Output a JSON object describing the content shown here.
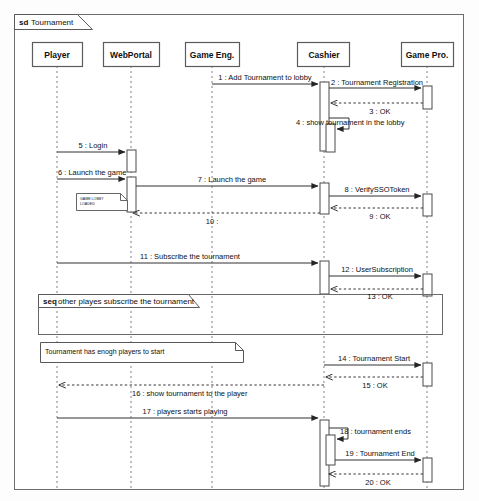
{
  "diagram": {
    "kind": "uml-sequence-diagram",
    "frame": {
      "keyword": "sd",
      "name": "Tournament"
    },
    "colors": {
      "line": "#303030",
      "lifeline": "#707070",
      "box_fill": "#ffffff",
      "text": "#101010"
    },
    "lifelines": [
      {
        "id": "player",
        "label": "Player",
        "x": 57,
        "box_x": 32,
        "box_w": 50
      },
      {
        "id": "webportal",
        "label": "WebPortal",
        "x": 131,
        "box_x": 104,
        "box_w": 56
      },
      {
        "id": "gameeng",
        "label": "Game Eng.",
        "x": 212,
        "box_x": 186,
        "box_w": 54
      },
      {
        "id": "cashier",
        "label": "Cashier",
        "x": 324,
        "box_x": 298,
        "box_w": 52
      },
      {
        "id": "gamepro",
        "label": "Game Pro.",
        "x": 427,
        "box_x": 402,
        "box_w": 52
      }
    ],
    "messages": [
      {
        "num": "1",
        "text": "1 : Add Tournament to lobby",
        "from": "gameeng",
        "to": "cashier",
        "y": 79,
        "style": "solid",
        "dir": "right"
      },
      {
        "num": "2",
        "text": "2 : Tournament Registration",
        "from": "cashier",
        "to": "gamepro",
        "y": 84,
        "style": "solid",
        "dir": "right"
      },
      {
        "num": "3",
        "text": "3 : OK",
        "from": "gamepro",
        "to": "cashier",
        "y": 104,
        "style": "dashed",
        "dir": "left"
      },
      {
        "num": "4",
        "text": "4 : show tournament in the lobby",
        "from": "cashier",
        "to": "cashier",
        "y": 124,
        "style": "solid",
        "dir": "self"
      },
      {
        "num": "5",
        "text": "5 : Login",
        "from": "player",
        "to": "webportal",
        "y": 148,
        "style": "solid",
        "dir": "right"
      },
      {
        "num": "6",
        "text": "6 : Launch the game",
        "from": "player",
        "to": "webportal",
        "y": 175,
        "style": "solid",
        "dir": "right"
      },
      {
        "num": "7",
        "text": "7 : Launch the game",
        "from": "webportal",
        "to": "cashier",
        "y": 180,
        "style": "solid",
        "dir": "right"
      },
      {
        "num": "8",
        "text": "8 : VerifySSOToken",
        "from": "cashier",
        "to": "gamepro",
        "y": 192,
        "style": "solid",
        "dir": "right"
      },
      {
        "num": "9",
        "text": "9 : OK",
        "from": "gamepro",
        "to": "cashier",
        "y": 209,
        "style": "dashed",
        "dir": "left"
      },
      {
        "num": "10",
        "text": "10 :",
        "from": "cashier",
        "to": "webportal",
        "y": 213,
        "style": "dashed",
        "dir": "left"
      },
      {
        "num": "11",
        "text": "11 : Subscribe the tournament",
        "from": "player",
        "to": "cashier",
        "y": 259,
        "style": "solid",
        "dir": "right"
      },
      {
        "num": "12",
        "text": "12 : UserSubscription",
        "from": "cashier",
        "to": "gamepro",
        "y": 272,
        "style": "solid",
        "dir": "right"
      },
      {
        "num": "13",
        "text": "13 : OK",
        "from": "gamepro",
        "to": "cashier",
        "y": 289,
        "style": "dashed",
        "dir": "left"
      },
      {
        "num": "14",
        "text": "14 : Tournament Start",
        "from": "cashier",
        "to": "gamepro",
        "y": 361,
        "style": "solid",
        "dir": "right"
      },
      {
        "num": "15",
        "text": "15 : OK",
        "from": "gamepro",
        "to": "cashier",
        "y": 378,
        "style": "dashed",
        "dir": "left"
      },
      {
        "num": "16",
        "text": "16 : show tournament to the player",
        "from": "cashier",
        "to": "player",
        "y": 385,
        "style": "dashed",
        "dir": "left"
      },
      {
        "num": "17",
        "text": "17 : players starts playing",
        "from": "player",
        "to": "cashier",
        "y": 418,
        "style": "solid",
        "dir": "right"
      },
      {
        "num": "18",
        "text": "18 : tournament ends",
        "from": "cashier",
        "to": "cashier",
        "y": 434,
        "style": "solid",
        "dir": "self"
      },
      {
        "num": "19",
        "text": "19 : Tournament End",
        "from": "cashier",
        "to": "gamepro",
        "y": 456,
        "style": "solid",
        "dir": "right"
      },
      {
        "num": "20",
        "text": "20 : OK",
        "from": "gamepro",
        "to": "cashier",
        "y": 483,
        "style": "dashed",
        "dir": "left"
      }
    ],
    "fragments": [
      {
        "id": "seq-other-players",
        "keyword": "seq",
        "name": "other playes subscribe the tournament",
        "x": 38,
        "y": 294,
        "w": 404,
        "h": 40,
        "tab_w": 160,
        "tab_h": 13
      }
    ],
    "notes": [
      {
        "id": "note-game-lobby",
        "text": "GAME LOBBY LOADED",
        "lines": [
          "GAME LOBBY",
          "LOADED"
        ],
        "x": 76,
        "y": 193,
        "w": 51,
        "h": 17,
        "size": "tiny"
      },
      {
        "id": "note-enough-players",
        "text": "Tournament has enogh players to start",
        "lines": [
          "Tournament has enogh players to start"
        ],
        "x": 40,
        "y": 342,
        "w": 203,
        "h": 20,
        "size": "normal"
      }
    ],
    "activations": [
      {
        "on": "cashier",
        "x": 320,
        "y": 82,
        "w": 9,
        "h": 69
      },
      {
        "on": "cashier",
        "x": 326,
        "y": 124,
        "w": 9,
        "h": 28
      },
      {
        "on": "gamepro",
        "x": 423,
        "y": 86,
        "w": 9,
        "h": 23
      },
      {
        "on": "webportal",
        "x": 127,
        "y": 150,
        "w": 9,
        "h": 22
      },
      {
        "on": "webportal",
        "x": 127,
        "y": 177,
        "w": 9,
        "h": 35
      },
      {
        "on": "cashier",
        "x": 320,
        "y": 183,
        "w": 9,
        "h": 31
      },
      {
        "on": "gamepro",
        "x": 423,
        "y": 194,
        "w": 9,
        "h": 22
      },
      {
        "on": "cashier",
        "x": 320,
        "y": 261,
        "w": 9,
        "h": 33
      },
      {
        "on": "gamepro",
        "x": 423,
        "y": 274,
        "w": 9,
        "h": 22
      },
      {
        "on": "gamepro",
        "x": 423,
        "y": 363,
        "w": 9,
        "h": 23
      },
      {
        "on": "cashier",
        "x": 320,
        "y": 420,
        "w": 9,
        "h": 66
      },
      {
        "on": "cashier",
        "x": 326,
        "y": 435,
        "w": 9,
        "h": 30
      },
      {
        "on": "gamepro",
        "x": 423,
        "y": 458,
        "w": 9,
        "h": 24
      }
    ],
    "geometry": {
      "frame_x": 14,
      "frame_y": 14,
      "frame_w": 450,
      "frame_h": 476,
      "tab_w": 78,
      "tab_h": 15,
      "lifeline_box_y": 42,
      "lifeline_box_h": 24,
      "lifeline_bottom": 490
    }
  }
}
